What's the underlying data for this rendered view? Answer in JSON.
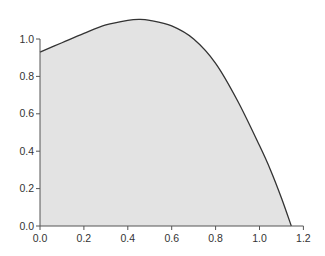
{
  "chart_data": {
    "type": "area",
    "title": "",
    "xlabel": "",
    "ylabel": "",
    "xlim": [
      0.0,
      1.2
    ],
    "ylim": [
      0.0,
      1.0
    ],
    "grid": false,
    "legend": null,
    "x_ticks": [
      "0.0",
      "0.2",
      "0.4",
      "0.6",
      "0.8",
      "1.0",
      "1.2"
    ],
    "y_ticks": [
      "0.0",
      "0.2",
      "0.4",
      "0.6",
      "0.8",
      "1.0"
    ],
    "series": [
      {
        "name": "curve",
        "x": [
          0.0,
          0.1,
          0.2,
          0.3,
          0.4,
          0.45,
          0.5,
          0.6,
          0.7,
          0.8,
          0.9,
          1.0,
          1.05,
          1.1,
          1.145
        ],
        "y": [
          0.93,
          0.98,
          1.03,
          1.075,
          1.1,
          1.105,
          1.1,
          1.07,
          1.0,
          0.87,
          0.67,
          0.43,
          0.3,
          0.15,
          0.0
        ],
        "fill": "#e3e3e3",
        "line_color": "#333333"
      }
    ]
  },
  "colors": {
    "fill": "#e3e3e3",
    "line": "#333333",
    "axis": "#555555"
  }
}
